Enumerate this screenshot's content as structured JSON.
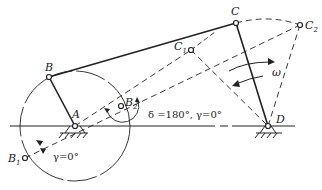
{
  "diagram": {
    "points": {
      "A": {
        "label": "A",
        "x": 75,
        "y": 126
      },
      "B": {
        "label": "B",
        "x": 49,
        "y": 77
      },
      "B1": {
        "label": "B",
        "sub": "1",
        "x": 25,
        "y": 158
      },
      "B2": {
        "label": "B",
        "sub": "2",
        "x": 121,
        "y": 106
      },
      "C": {
        "label": "C",
        "x": 236,
        "y": 23
      },
      "C1": {
        "label": "C",
        "sub": "1",
        "x": 191,
        "y": 50
      },
      "C2": {
        "label": "C",
        "sub": "2",
        "x": 300,
        "y": 25
      },
      "D": {
        "label": "D",
        "x": 268,
        "y": 126
      }
    },
    "annotations": {
      "delta_gamma": "δ =180°, γ=0°",
      "gamma": "γ=0°",
      "omega": "ω"
    },
    "colors": {
      "line": "#222222",
      "background": "#ffffff"
    }
  }
}
